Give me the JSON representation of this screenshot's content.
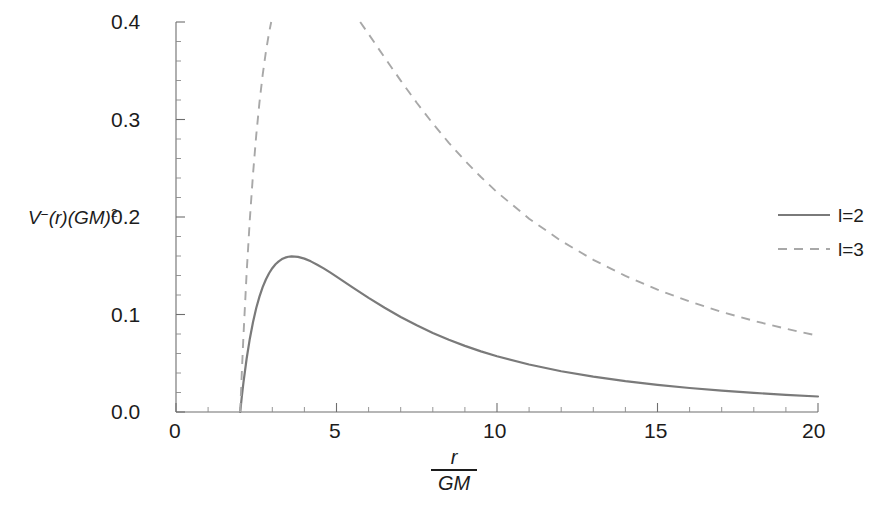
{
  "chart_data": {
    "type": "line",
    "title": "",
    "subtitle": "",
    "xlabel": "r / GM",
    "xlabel_numerator": "r",
    "xlabel_denominator": "GM",
    "ylabel": "V⁻(r)(GM)²",
    "ylabel_parts": {
      "v": "V",
      "minus": "−",
      "of_r": "(r)",
      "gm": "(GM)",
      "exp": "2"
    },
    "xlim": [
      0,
      20
    ],
    "ylim": [
      0.0,
      0.4
    ],
    "x_ticks": [
      0,
      5,
      10,
      15,
      20
    ],
    "x_tick_labels": [
      "0",
      "5",
      "10",
      "15",
      "20"
    ],
    "x_minor_tick_step": 1,
    "y_ticks": [
      0.0,
      0.1,
      0.2,
      0.3,
      0.4
    ],
    "y_tick_labels": [
      "0.0",
      "0.1",
      "0.2",
      "0.3",
      "0.4"
    ],
    "y_minor_tick_step": 0.02,
    "grid": false,
    "legend_position": "right",
    "colors": {
      "solid": "#7a7a7a",
      "dashed": "#a8a8a8",
      "axis": "#6e6e6e",
      "text": "#1c1c1c",
      "background": "#ffffff"
    },
    "annotations": [
      {
        "text": "curves begin at r/GM = 2 (horizon) where V = 0"
      }
    ],
    "series": [
      {
        "name": "l=2",
        "style": "solid",
        "color": "#7a7a7a",
        "peak": {
          "x": 3.28,
          "y": 0.151
        },
        "x": [
          2.0,
          2.05,
          2.1,
          2.2,
          2.3,
          2.4,
          2.5,
          2.6,
          2.7,
          2.8,
          2.9,
          3.0,
          3.1,
          3.2,
          3.3,
          3.4,
          3.5,
          3.6,
          3.8,
          4.0,
          4.2,
          4.4,
          4.6,
          4.8,
          5.0,
          5.5,
          6.0,
          6.5,
          7.0,
          7.5,
          8.0,
          8.5,
          9.0,
          9.5,
          10.0,
          11.0,
          12.0,
          13.0,
          14.0,
          15.0,
          16.0,
          17.0,
          18.0,
          19.0,
          20.0
        ],
        "y": [
          0.0,
          0.0157,
          0.0299,
          0.0546,
          0.0752,
          0.0923,
          0.1066,
          0.1183,
          0.128,
          0.1359,
          0.1423,
          0.1475,
          0.1515,
          0.1545,
          0.1568,
          0.1583,
          0.1592,
          0.1596,
          0.1591,
          0.1573,
          0.1545,
          0.1511,
          0.1473,
          0.1432,
          0.1389,
          0.1279,
          0.1171,
          0.1069,
          0.0975,
          0.0889,
          0.0811,
          0.0741,
          0.0678,
          0.0622,
          0.0572,
          0.0487,
          0.0418,
          0.0362,
          0.0316,
          0.0278,
          0.0246,
          0.0219,
          0.0196,
          0.0176,
          0.0159
        ]
      },
      {
        "name": "l=3",
        "style": "dashed",
        "color": "#a8a8a8",
        "peak": {
          "x": 3.1,
          "y": 0.371
        },
        "x": [
          2.0,
          2.05,
          2.1,
          2.2,
          2.3,
          2.4,
          2.5,
          2.6,
          2.7,
          2.8,
          2.9,
          3.0,
          3.1,
          3.2,
          3.3,
          3.4,
          3.5,
          3.6,
          3.8,
          4.0,
          4.2,
          4.4,
          4.6,
          4.8,
          5.0,
          5.5,
          6.0,
          6.5,
          7.0,
          7.5,
          8.0,
          8.5,
          9.0,
          9.5,
          10.0,
          11.0,
          12.0,
          13.0,
          14.0,
          15.0,
          16.0,
          17.0,
          18.0,
          19.0,
          20.0
        ],
        "y": [
          0.0,
          0.0403,
          0.0772,
          0.1424,
          0.1976,
          0.2444,
          0.284,
          0.3175,
          0.3457,
          0.3694,
          0.3892,
          0.4056,
          0.4191,
          0.43,
          0.4387,
          0.4455,
          0.4506,
          0.4543,
          0.4583,
          0.4589,
          0.4569,
          0.4529,
          0.4474,
          0.4407,
          0.4331,
          0.4113,
          0.3876,
          0.3635,
          0.3399,
          0.3172,
          0.2959,
          0.2761,
          0.2578,
          0.241,
          0.2255,
          0.1983,
          0.1754,
          0.1561,
          0.1396,
          0.1255,
          0.1133,
          0.1027,
          0.0935,
          0.0854,
          0.0782
        ]
      }
    ]
  },
  "legend": {
    "entries": [
      {
        "label": "l=2",
        "style": "solid"
      },
      {
        "label": "l=3",
        "style": "dashed"
      }
    ]
  },
  "axes": {
    "y_labels": [
      "0.4",
      "0.3",
      "0.2",
      "0.1",
      "0.0"
    ],
    "x_labels": [
      "0",
      "5",
      "10",
      "15",
      "20"
    ]
  }
}
